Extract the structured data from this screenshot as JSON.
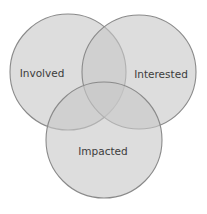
{
  "diagram": {
    "type": "venn",
    "background": "#ffffff",
    "fill_color": "#c8c8c8",
    "stroke_color": "#8a8a8a",
    "text_color": "#3c3c3c",
    "sets": [
      {
        "id": "involved",
        "label": "Involved",
        "cx": 68,
        "cy": 72,
        "r": 58,
        "label_x": 42,
        "label_y": 77
      },
      {
        "id": "interested",
        "label": "Interested",
        "cx": 139,
        "cy": 72,
        "r": 57,
        "label_x": 161,
        "label_y": 78
      },
      {
        "id": "impacted",
        "label": "Impacted",
        "cx": 104,
        "cy": 140,
        "r": 58,
        "label_x": 103,
        "label_y": 155
      }
    ]
  }
}
